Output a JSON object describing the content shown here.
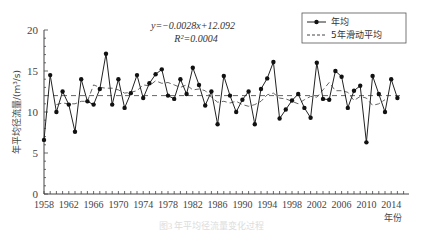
{
  "chart_data": {
    "type": "line",
    "title": "",
    "xlabel": "年份",
    "ylabel": "年平均径流量/(m³/s)",
    "xlim": [
      1958,
      2016
    ],
    "ylim": [
      0,
      20
    ],
    "yticks": [
      0,
      5,
      10,
      15,
      20
    ],
    "xticks": [
      1958,
      1962,
      1966,
      1970,
      1974,
      1978,
      1982,
      1986,
      1990,
      1994,
      1998,
      2002,
      2006,
      2010,
      2014
    ],
    "grid": false,
    "legend_position": "upper right",
    "annotations": {
      "equation": "y=−0.0028x+12.092",
      "r_squared": "R²=0.0004"
    },
    "x": [
      1958,
      1959,
      1960,
      1961,
      1962,
      1963,
      1964,
      1965,
      1966,
      1967,
      1968,
      1969,
      1970,
      1971,
      1972,
      1973,
      1974,
      1975,
      1976,
      1977,
      1978,
      1979,
      1980,
      1981,
      1982,
      1983,
      1984,
      1985,
      1986,
      1987,
      1988,
      1989,
      1990,
      1991,
      1992,
      1993,
      1994,
      1995,
      1996,
      1997,
      1998,
      1999,
      2000,
      2001,
      2002,
      2003,
      2004,
      2005,
      2006,
      2007,
      2008,
      2009,
      2010,
      2011,
      2012,
      2013,
      2014,
      2015
    ],
    "series": [
      {
        "name": "年均",
        "style": "solid-line-with-dots",
        "values": [
          6.6,
          14.5,
          10.0,
          12.5,
          10.9,
          7.6,
          14.0,
          11.3,
          10.9,
          12.8,
          17.1,
          10.9,
          14.0,
          10.5,
          12.3,
          14.5,
          11.7,
          13.5,
          14.6,
          15.2,
          12.0,
          11.6,
          14.0,
          12.2,
          15.4,
          13.3,
          10.8,
          12.5,
          8.5,
          14.4,
          12.0,
          10.0,
          11.5,
          12.5,
          8.5,
          12.8,
          14.1,
          16.1,
          9.2,
          10.3,
          11.4,
          12.2,
          10.5,
          9.3,
          16.0,
          11.6,
          11.5,
          15.0,
          14.3,
          10.5,
          12.6,
          13.2,
          6.3,
          14.4,
          12.2,
          10.0,
          14.0,
          11.7
        ]
      },
      {
        "name": "5年滑动平均",
        "style": "dashed",
        "values": [
          null,
          null,
          10.9,
          11.1,
          11.0,
          11.0,
          11.3,
          11.3,
          13.3,
          13.0,
          12.9,
          12.9,
          12.7,
          12.3,
          12.4,
          12.6,
          13.3,
          13.2,
          13.8,
          13.5,
          13.6,
          13.3,
          13.0,
          13.3,
          12.7,
          12.8,
          12.6,
          11.8,
          11.2,
          11.3,
          11.1,
          11.3,
          10.9,
          10.7,
          10.9,
          11.3,
          12.1,
          12.3,
          11.7,
          11.6,
          11.3,
          11.0,
          11.5,
          11.9,
          11.8,
          12.7,
          13.6,
          12.6,
          12.6,
          12.4,
          11.4,
          11.9,
          11.7,
          10.8,
          11.0,
          11.5,
          null,
          null
        ]
      },
      {
        "name": "trend",
        "style": "dashed-horizontal",
        "values_formula": "y=-0.0028x+12.092",
        "approx_value": 12.0
      }
    ]
  },
  "legend": {
    "items": [
      {
        "label": "年均"
      },
      {
        "label": "5年滑动平均"
      }
    ]
  },
  "axes": {
    "xlabel": "年份",
    "ylabel": "年平均径流量/(m³/s)"
  },
  "annotation": {
    "equation": "y=−0.0028x+12.092",
    "r2": "R²=0.0004"
  },
  "caption": "图3  年平均径流量变化过程"
}
